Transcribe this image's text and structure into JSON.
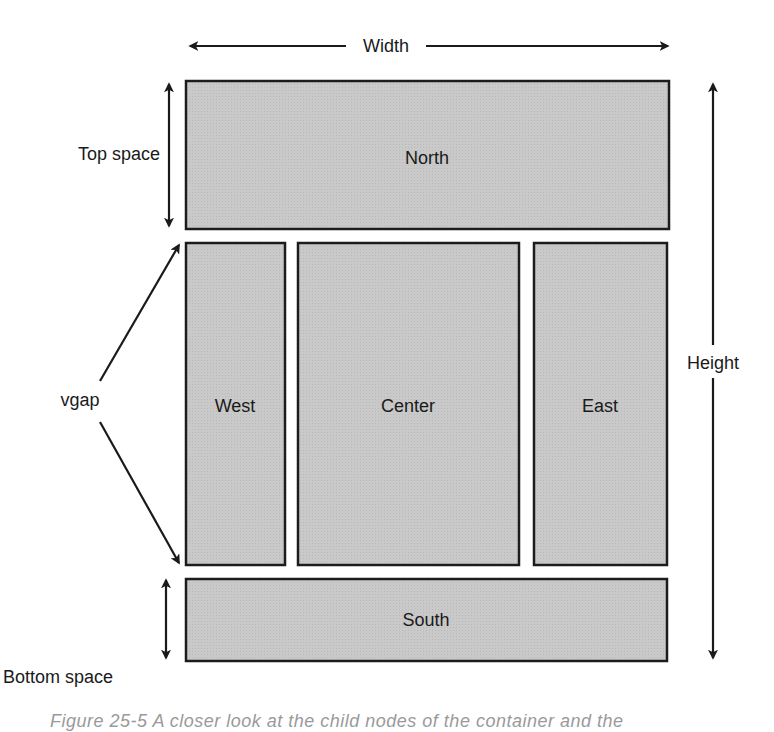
{
  "diagram": {
    "colors": {
      "region_fill": "#c7c7c7",
      "region_border": "#1c1c1c",
      "text": "#1a1a1a",
      "background": "#ffffff"
    },
    "regions": {
      "north": {
        "label": "North",
        "x": 186,
        "y": 81,
        "w": 483,
        "h": 148
      },
      "west": {
        "label": "West",
        "x": 186,
        "y": 243,
        "w": 99,
        "h": 322
      },
      "center": {
        "label": "Center",
        "x": 298,
        "y": 243,
        "w": 221,
        "h": 322
      },
      "east": {
        "label": "East",
        "x": 534,
        "y": 243,
        "w": 133,
        "h": 322
      },
      "south": {
        "label": "South",
        "x": 186,
        "y": 579,
        "w": 481,
        "h": 82
      }
    },
    "dimensions": {
      "width": {
        "label": "Width"
      },
      "height": {
        "label": "Height"
      },
      "top_space": {
        "label": "Top space"
      },
      "bottom_space": {
        "label": "Bottom space"
      },
      "vgap": {
        "label": "vgap"
      }
    },
    "caption": "Figure 25-5  A closer look at the child nodes of the container and the"
  }
}
